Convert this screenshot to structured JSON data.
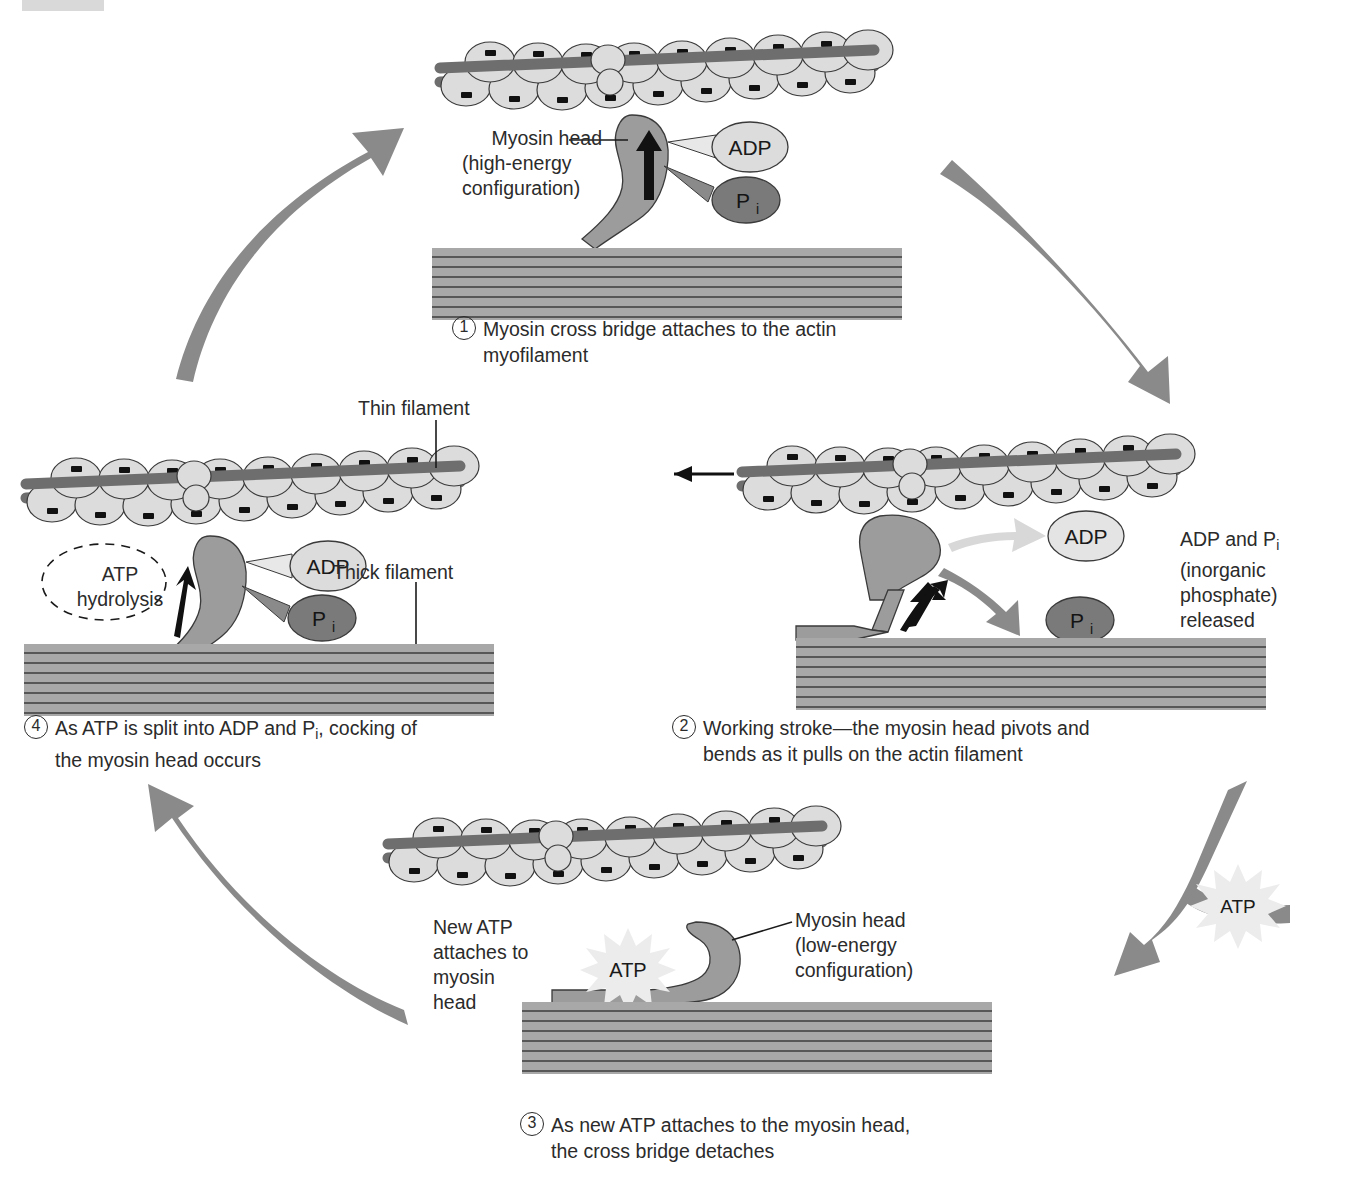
{
  "figure": {
    "colors": {
      "actin_bead": "#dcdcdc",
      "tropomyosin": "#6e6e6e",
      "myosin_head": "#9c9c9c",
      "thick_filament": "#a8a8a8",
      "adp": "#dcdcdc",
      "pi": "#7a7a7a",
      "cycle_arrow": "#8a8a8a",
      "atp_burst": "#ececec",
      "outline": "#2b2b2b"
    }
  },
  "steps": [
    {
      "number": "1",
      "caption_line1": "Myosin cross bridge attaches to the actin",
      "caption_line2": "myofilament",
      "labels": {
        "myosin_head_l1": "Myosin head",
        "myosin_head_l2": "(high-energy",
        "myosin_head_l3": "configuration)",
        "adp": "ADP",
        "pi_p": "P",
        "pi_sub": "i"
      }
    },
    {
      "number": "2",
      "caption_line1": "Working stroke—the myosin head pivots and",
      "caption_line2": "bends as it pulls on the actin filament",
      "labels": {
        "adp": "ADP",
        "pi_p": "P",
        "pi_sub": "i",
        "release_l1a": "ADP and P",
        "release_l1b": "i",
        "release_l2": "(inorganic",
        "release_l3": "phosphate)",
        "release_l4": "released"
      }
    },
    {
      "number": "3",
      "caption_line1": "As new ATP attaches to the myosin head,",
      "caption_line2": "the cross bridge detaches",
      "labels": {
        "new_atp_l1": "New ATP",
        "new_atp_l2": "attaches to",
        "new_atp_l3": "myosin",
        "new_atp_l4": "head",
        "atp_burst": "ATP",
        "myosin_head_l1": "Myosin head",
        "myosin_head_l2": "(low-energy",
        "myosin_head_l3": "configuration)"
      }
    },
    {
      "number": "4",
      "caption_line1a": "As ATP is split into ADP and P",
      "caption_line1b": "i",
      "caption_line1c": ", cocking of",
      "caption_line2": "the myosin head occurs",
      "labels": {
        "thin_filament": "Thin filament",
        "thick_filament": "Thick filament",
        "atp_hydrolysis_l1": "ATP",
        "atp_hydrolysis_l2": "hydrolysis",
        "adp": "ADP",
        "pi_p": "P",
        "pi_sub": "i"
      }
    }
  ],
  "cycle": {
    "atp_input_burst": "ATP"
  }
}
